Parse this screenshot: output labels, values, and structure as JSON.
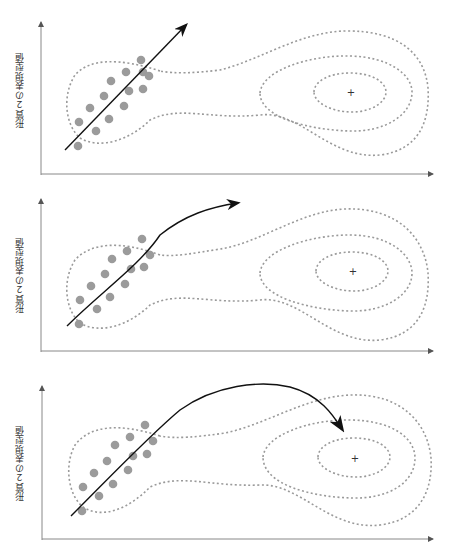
{
  "figure": {
    "header_text": "",
    "panels": [
      {
        "id": "panel-1",
        "y_axis_label": "形質２の表現型値",
        "description": "Selection response arrow aligned with genetic correlation within the local peak",
        "arrow_type": "straight"
      },
      {
        "id": "panel-2",
        "y_axis_label": "形質２の表現型値",
        "description": "Response arrow curves upward leaving the local peak",
        "arrow_type": "curved-up"
      },
      {
        "id": "panel-3",
        "y_axis_label": "形質２の表現型値",
        "description": "Response arrow arcs over the valley toward the higher fitness peak",
        "arrow_type": "curved-to-peak"
      }
    ],
    "peak_marker": "+",
    "colors": {
      "axis": "#888888",
      "contour": "#9a9a9a",
      "dot": "#9b9b9b",
      "arrow": "#111111"
    }
  }
}
